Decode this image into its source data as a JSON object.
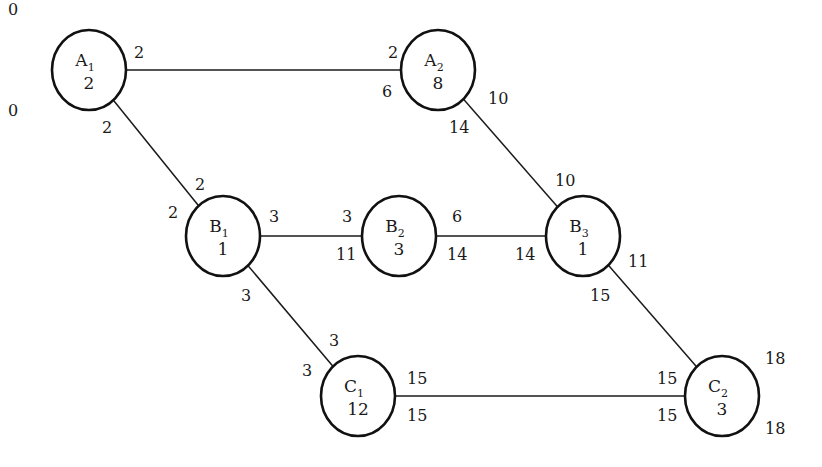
{
  "diagram": {
    "type": "activity-on-node network",
    "nodes": [
      {
        "id": "A1",
        "letter": "A",
        "sub": "1",
        "duration": "2",
        "cx": 89,
        "cy": 70,
        "labels": [
          {
            "text": "0",
            "x": 8,
            "y": 15
          },
          {
            "text": "0",
            "x": 8,
            "y": 116
          },
          {
            "text": "2",
            "x": 134,
            "y": 58
          },
          {
            "text": "2",
            "x": 102,
            "y": 133
          }
        ]
      },
      {
        "id": "A2",
        "letter": "A",
        "sub": "2",
        "duration": "8",
        "cx": 438,
        "cy": 70,
        "labels": [
          {
            "text": "2",
            "x": 388,
            "y": 58
          },
          {
            "text": "6",
            "x": 382,
            "y": 97
          },
          {
            "text": "10",
            "x": 488,
            "y": 104
          },
          {
            "text": "14",
            "x": 449,
            "y": 133
          }
        ]
      },
      {
        "id": "B1",
        "letter": "B",
        "sub": "1",
        "duration": "1",
        "cx": 223,
        "cy": 236,
        "labels": [
          {
            "text": "2",
            "x": 195,
            "y": 190
          },
          {
            "text": "2",
            "x": 168,
            "y": 218
          },
          {
            "text": "3",
            "x": 269,
            "y": 222
          },
          {
            "text": "3",
            "x": 241,
            "y": 301
          }
        ]
      },
      {
        "id": "B2",
        "letter": "B",
        "sub": "2",
        "duration": "3",
        "cx": 399,
        "cy": 236,
        "labels": [
          {
            "text": "3",
            "x": 342,
            "y": 222
          },
          {
            "text": "11",
            "x": 336,
            "y": 260
          },
          {
            "text": "6",
            "x": 452,
            "y": 222
          },
          {
            "text": "14",
            "x": 447,
            "y": 260
          }
        ]
      },
      {
        "id": "B3",
        "letter": "B",
        "sub": "3",
        "duration": "1",
        "cx": 583,
        "cy": 236,
        "labels": [
          {
            "text": "10",
            "x": 555,
            "y": 186
          },
          {
            "text": "14",
            "x": 515,
            "y": 260
          },
          {
            "text": "11",
            "x": 628,
            "y": 267
          },
          {
            "text": "15",
            "x": 590,
            "y": 301
          }
        ]
      },
      {
        "id": "C1",
        "letter": "C",
        "sub": "1",
        "duration": "12",
        "cx": 358,
        "cy": 396,
        "labels": [
          {
            "text": "3",
            "x": 329,
            "y": 346
          },
          {
            "text": "3",
            "x": 302,
            "y": 376
          },
          {
            "text": "15",
            "x": 407,
            "y": 384
          },
          {
            "text": "15",
            "x": 407,
            "y": 421
          }
        ]
      },
      {
        "id": "C2",
        "letter": "C",
        "sub": "2",
        "duration": "3",
        "cx": 722,
        "cy": 396,
        "labels": [
          {
            "text": "15",
            "x": 657,
            "y": 384
          },
          {
            "text": "15",
            "x": 657,
            "y": 421
          },
          {
            "text": "18",
            "x": 765,
            "y": 364
          },
          {
            "text": "18",
            "x": 765,
            "y": 434
          }
        ]
      }
    ],
    "edges": [
      {
        "from": "A1",
        "to": "A2"
      },
      {
        "from": "A1",
        "to": "B1"
      },
      {
        "from": "A2",
        "to": "B3"
      },
      {
        "from": "B1",
        "to": "B2"
      },
      {
        "from": "B2",
        "to": "B3"
      },
      {
        "from": "B1",
        "to": "C1"
      },
      {
        "from": "B3",
        "to": "C2"
      },
      {
        "from": "C1",
        "to": "C2"
      }
    ]
  }
}
